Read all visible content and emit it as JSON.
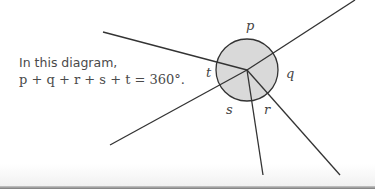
{
  "caption": {
    "line1": "In this diagram,",
    "line2": "p + q + r + s + t = 360°."
  },
  "diagram": {
    "center": [
      247,
      70
    ],
    "radius": 31,
    "circle_fill": "#d9d9d9",
    "line_color": "#333333",
    "rays": [
      {
        "to": [
          103,
          32
        ]
      },
      {
        "to": [
          355,
          0
        ]
      },
      {
        "to": [
          110,
          145
        ]
      },
      {
        "to": [
          263,
          175
        ]
      },
      {
        "to": [
          340,
          175
        ]
      }
    ],
    "labels": [
      {
        "text": "p",
        "x": 246,
        "y": 30
      },
      {
        "text": "q",
        "x": 286,
        "y": 78
      },
      {
        "text": "r",
        "x": 264,
        "y": 114
      },
      {
        "text": "s",
        "x": 226,
        "y": 114
      },
      {
        "text": "t",
        "x": 206,
        "y": 77
      }
    ]
  }
}
